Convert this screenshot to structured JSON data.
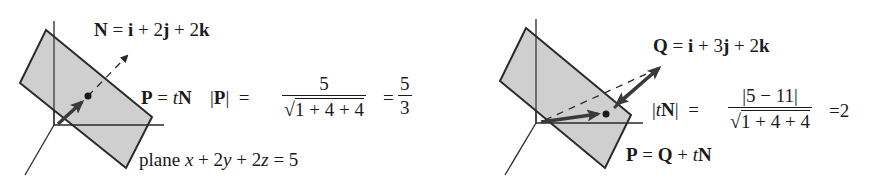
{
  "figure": {
    "left": {
      "normal_label": "N = i + 2j + 2k",
      "normal_parts": [
        "N",
        " = ",
        "i",
        " + 2",
        "j",
        " + 2",
        "k"
      ],
      "projection_label": {
        "P": "P",
        "eq": " = ",
        "t": "t",
        "N": "N"
      },
      "magnitude": {
        "lhs_open": "|",
        "lhs_P": "P",
        "lhs_close": "|",
        "eq": "="
      },
      "fraction_1": {
        "numerator": "5",
        "denominator": "1 + 4 + 4",
        "radical": "√"
      },
      "result_eq": "=",
      "fraction_2": {
        "numerator": "5",
        "denominator": "3"
      },
      "plane_label": {
        "word": "plane ",
        "x": "x",
        "p1": " + 2",
        "y": "y",
        "p2": " + 2",
        "z": "z",
        "rhs": " = 5"
      }
    },
    "right": {
      "point_label": "Q = i + 3j + 2k",
      "point_parts": [
        "Q",
        " = ",
        "i",
        " + 3",
        "j",
        " + 2",
        "k"
      ],
      "magnitude": {
        "open": "|",
        "t": "t",
        "N": "N",
        "close": "|",
        "eq": "="
      },
      "fraction": {
        "numerator": "|5 − 11|",
        "denominator": "1 + 4 + 4",
        "radical": "√"
      },
      "result": "=2",
      "foot_label": {
        "P": "P",
        "eq": " = ",
        "Q": "Q",
        "plus": " + ",
        "t": "t",
        "N": "N"
      }
    },
    "colors": {
      "plane_fill": "#cfcfcf",
      "stroke": "#2a2a2a",
      "arrow": "#3a3a3a"
    }
  }
}
